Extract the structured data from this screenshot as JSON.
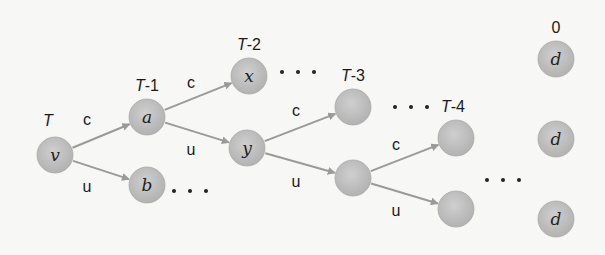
{
  "diagram": {
    "colors": {
      "background": "#f7f7f5",
      "node_fill": "#bdbdbd",
      "node_stroke": "#a9a9a9",
      "edge": "#9a9a9a",
      "text": "#1a1a1a"
    },
    "time_labels": [
      {
        "id": "t0",
        "text": "T",
        "x": 48,
        "y": 126
      },
      {
        "id": "t1",
        "text": "T-1",
        "x": 147,
        "y": 91
      },
      {
        "id": "t2",
        "text": "T-2",
        "x": 249,
        "y": 50
      },
      {
        "id": "t3",
        "text": "T-3",
        "x": 353,
        "y": 81
      },
      {
        "id": "t4",
        "text": "T-4",
        "x": 453,
        "y": 112
      },
      {
        "id": "t5",
        "text": "0",
        "x": 556,
        "y": 33
      }
    ],
    "nodes": [
      {
        "id": "v",
        "label": "v",
        "x": 55,
        "y": 155
      },
      {
        "id": "a",
        "label": "a",
        "x": 147,
        "y": 117
      },
      {
        "id": "b",
        "label": "b",
        "x": 147,
        "y": 185
      },
      {
        "id": "x",
        "label": "x",
        "x": 249,
        "y": 76
      },
      {
        "id": "y",
        "label": "y",
        "x": 247,
        "y": 148
      },
      {
        "id": "n3a",
        "label": "",
        "x": 353,
        "y": 107
      },
      {
        "id": "n3b",
        "label": "",
        "x": 353,
        "y": 178
      },
      {
        "id": "n4a",
        "label": "",
        "x": 456,
        "y": 138
      },
      {
        "id": "n4b",
        "label": "",
        "x": 456,
        "y": 209
      },
      {
        "id": "d1",
        "label": "d",
        "x": 556,
        "y": 59
      },
      {
        "id": "d2",
        "label": "d",
        "x": 556,
        "y": 139
      },
      {
        "id": "d3",
        "label": "d",
        "x": 556,
        "y": 219
      }
    ],
    "edges": [
      {
        "from": "v",
        "to": "a",
        "label": "c",
        "lx": 87,
        "ly": 125
      },
      {
        "from": "v",
        "to": "b",
        "label": "u",
        "lx": 87,
        "ly": 192
      },
      {
        "from": "a",
        "to": "x",
        "label": "c",
        "lx": 191,
        "ly": 88
      },
      {
        "from": "a",
        "to": "y",
        "label": "u",
        "lx": 191,
        "ly": 155
      },
      {
        "from": "y",
        "to": "n3a",
        "label": "c",
        "lx": 296,
        "ly": 116
      },
      {
        "from": "y",
        "to": "n3b",
        "label": "u",
        "lx": 296,
        "ly": 187
      },
      {
        "from": "n3b",
        "to": "n4a",
        "label": "c",
        "lx": 396,
        "ly": 150
      },
      {
        "from": "n3b",
        "to": "n4b",
        "label": "u",
        "lx": 396,
        "ly": 216
      }
    ],
    "ellipses": [
      {
        "id": "after-b",
        "x": 174,
        "y": 191
      },
      {
        "id": "after-x",
        "x": 282,
        "y": 72
      },
      {
        "id": "after-n3a",
        "x": 395,
        "y": 107
      },
      {
        "id": "after-n4",
        "x": 487,
        "y": 180
      }
    ],
    "node_radius": 18
  }
}
